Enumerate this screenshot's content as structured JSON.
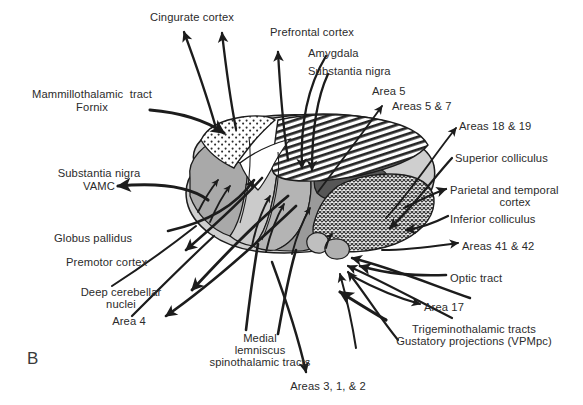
{
  "figure": {
    "panel_letter": "B",
    "type": "anatomical-diagram",
    "ink_color": "#1c1c1c",
    "background": "#ffffff"
  },
  "labels": [
    {
      "id": "cingulate-cortex",
      "text": "Cingurate cortex",
      "x": 132,
      "y": 11,
      "w": 120,
      "align": "center"
    },
    {
      "id": "prefrontal-cortex",
      "text": "Prefrontal cortex",
      "x": 270,
      "y": 26,
      "w": 108,
      "align": "left"
    },
    {
      "id": "amygdala",
      "text": "Amygdala",
      "x": 308,
      "y": 47,
      "w": 80,
      "align": "left"
    },
    {
      "id": "substantia-nigra-top",
      "text": "Substantia nigra",
      "x": 308,
      "y": 65,
      "w": 110,
      "align": "left"
    },
    {
      "id": "area-5",
      "text": "Area 5",
      "x": 372,
      "y": 85,
      "w": 56,
      "align": "left"
    },
    {
      "id": "areas-5-7",
      "text": "Areas 5 & 7",
      "x": 392,
      "y": 100,
      "w": 76,
      "align": "left"
    },
    {
      "id": "mammillothalamic-tract",
      "text": "Mammillothalamic  tract",
      "x": 16,
      "y": 88,
      "w": 152,
      "align": "center"
    },
    {
      "id": "fornix",
      "text": "Fornix",
      "x": 16,
      "y": 101,
      "w": 152,
      "align": "center"
    },
    {
      "id": "areas-18-19",
      "text": "Areas 18 & 19",
      "x": 459,
      "y": 120,
      "w": 96,
      "align": "left"
    },
    {
      "id": "superior-colliculus",
      "text": "Superior colliculus",
      "x": 455,
      "y": 152,
      "w": 124,
      "align": "left"
    },
    {
      "id": "substantia-nigra-left",
      "text": "Substantia nigra",
      "x": 36,
      "y": 167,
      "w": 126,
      "align": "center"
    },
    {
      "id": "vamc",
      "text": "VAMC",
      "x": 36,
      "y": 180,
      "w": 126,
      "align": "center"
    },
    {
      "id": "parietal-temporal-cortex",
      "text": "Parietal and temporal",
      "x": 450,
      "y": 184,
      "w": 130,
      "align": "left"
    },
    {
      "id": "parietal-temporal-cortex-2",
      "text": "cortex",
      "x": 450,
      "y": 196,
      "w": 130,
      "align": "center"
    },
    {
      "id": "inferior-colliculus",
      "text": "Inferior colliculus",
      "x": 450,
      "y": 213,
      "w": 120,
      "align": "left"
    },
    {
      "id": "globus-pallidus",
      "text": "Globus pallidus",
      "x": 54,
      "y": 232,
      "w": 110,
      "align": "left"
    },
    {
      "id": "areas-41-42",
      "text": "Areas 41 & 42",
      "x": 462,
      "y": 240,
      "w": 100,
      "align": "left"
    },
    {
      "id": "premotor-cortex",
      "text": "Premotor cortex",
      "x": 66,
      "y": 256,
      "w": 112,
      "align": "left"
    },
    {
      "id": "optic-tract",
      "text": "Optic tract",
      "x": 450,
      "y": 272,
      "w": 80,
      "align": "left"
    },
    {
      "id": "deep-cerebellar",
      "text": "Deep cerebellar",
      "x": 62,
      "y": 286,
      "w": 118,
      "align": "center"
    },
    {
      "id": "deep-cerebellar-2",
      "text": "nuclei",
      "x": 62,
      "y": 298,
      "w": 118,
      "align": "center"
    },
    {
      "id": "area-17",
      "text": "Area 17",
      "x": 424,
      "y": 301,
      "w": 62,
      "align": "left"
    },
    {
      "id": "area-4",
      "text": "Area 4",
      "x": 96,
      "y": 315,
      "w": 66,
      "align": "center"
    },
    {
      "id": "trigeminothalamic",
      "text": "Trigeminothalamic tracts",
      "x": 386,
      "y": 323,
      "w": 172,
      "align": "center"
    },
    {
      "id": "gustatory-projections",
      "text": "Gustatory projections (VPMpc)",
      "x": 376,
      "y": 335,
      "w": 194,
      "align": "center"
    },
    {
      "id": "medial",
      "text": "Medial",
      "x": 205,
      "y": 332,
      "w": 110,
      "align": "center"
    },
    {
      "id": "lemniscus",
      "text": "lemniscus",
      "x": 205,
      "y": 344,
      "w": 110,
      "align": "center"
    },
    {
      "id": "spinothalamic-tracts",
      "text": "spinothalamic tracts",
      "x": 205,
      "y": 356,
      "w": 110,
      "align": "center"
    },
    {
      "id": "areas-3-1-2",
      "text": "Areas 3, 1, & 2",
      "x": 276,
      "y": 380,
      "w": 104,
      "align": "center"
    }
  ],
  "regions": [
    {
      "id": "anterior-nucleus-stipple",
      "fill": "stipple-coarse",
      "note": "anterior nucleus, dotted/stippled, upper-left dorsal cap"
    },
    {
      "id": "dorsomedial-hatched",
      "fill": "hatch-diagonal",
      "note": "mediodorsal nucleus, diagonal hatching, dorsal surface"
    },
    {
      "id": "ventral-anterior-midgray",
      "fill": "#a9a9a9",
      "note": "ventral anterior, medium gray, anterior pole"
    },
    {
      "id": "ventral-lateral-lightgray",
      "fill": "#cbcbcb",
      "note": "ventral lateral, light gray"
    },
    {
      "id": "ventral-posterior-gray",
      "fill": "#b4b4b4",
      "note": "ventral posterior / VPL, gray"
    },
    {
      "id": "vpm-darkgray",
      "fill": "#9a9a9a",
      "note": "VPM, darker gray lobe"
    },
    {
      "id": "lateral-posterior-dark",
      "fill": "#565656",
      "note": "dark wedge, lateral posterior"
    },
    {
      "id": "pulvinar-crosshatch",
      "fill": "crosshatch-fine",
      "note": "pulvinar, fine cross-hatch, posterior"
    },
    {
      "id": "medial-geniculate",
      "fill": "#bfbfbf",
      "note": "medial geniculate body, small bump"
    },
    {
      "id": "lateral-geniculate",
      "fill": "#b0b0b0",
      "note": "lateral geniculate body, small bump"
    },
    {
      "id": "internal-medullary-lamina",
      "fill": "#ffffff",
      "note": "white lamina band separating dorsal groups"
    }
  ]
}
